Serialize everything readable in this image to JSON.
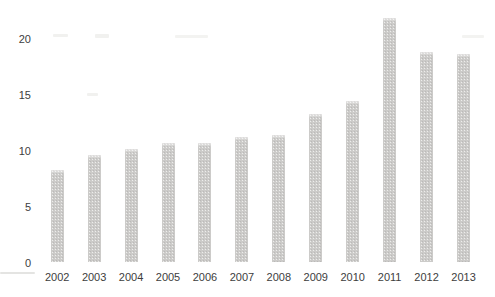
{
  "chart_data": {
    "type": "bar",
    "title": "",
    "xlabel": "",
    "ylabel": "",
    "categories": [
      "2002",
      "2003",
      "2004",
      "2005",
      "2006",
      "2007",
      "2008",
      "2009",
      "2010",
      "2011",
      "2012",
      "2013"
    ],
    "values": [
      8.3,
      9.6,
      10.1,
      10.7,
      10.7,
      11.2,
      11.4,
      13.3,
      14.4,
      21.8,
      18.8,
      18.6
    ],
    "ylim": [
      0,
      22.5
    ],
    "yticks": [
      0,
      5,
      10,
      15,
      20
    ],
    "grid": false,
    "legend": false,
    "bar_color": "#cccbc9",
    "axis_text_color": "#3d3d3d",
    "background_color": "#ffffff"
  }
}
